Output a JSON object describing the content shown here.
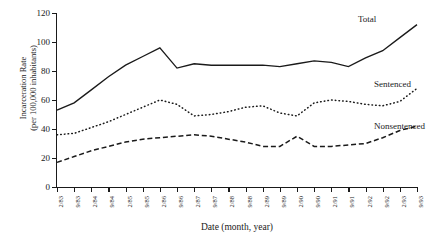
{
  "chart_data": {
    "type": "line",
    "title": "",
    "xlabel": "Date (month, year)",
    "ylabel_line1": "Incarceration Rate",
    "ylabel_line2": "(per 100,000 inhabitants)",
    "ylim": [
      0,
      120
    ],
    "yticks": [
      0,
      20,
      40,
      60,
      80,
      100,
      120
    ],
    "grid": false,
    "legend_position": "inline-right-of-line-ends",
    "categories": [
      "2/83",
      "9/83",
      "2/84",
      "9/84",
      "2/85",
      "9/85",
      "2/86",
      "9/86",
      "2/87",
      "9/87",
      "2/88",
      "9/88",
      "2/89",
      "9/89",
      "2/90",
      "9/90",
      "2/91",
      "9/91",
      "2/92",
      "9/92",
      "2/93",
      "9/93"
    ],
    "series": [
      {
        "name": "Total",
        "style": "solid",
        "values": [
          53,
          58,
          67,
          76,
          84,
          90,
          96,
          82,
          85,
          84,
          84,
          84,
          84,
          83,
          85,
          87,
          86,
          83,
          89,
          94,
          103,
          112
        ]
      },
      {
        "name": "Sentenced",
        "style": "dotted",
        "values": [
          36,
          37,
          41,
          45,
          50,
          55,
          60,
          57,
          49,
          50,
          52,
          55,
          56,
          51,
          49,
          58,
          60,
          59,
          57,
          56,
          59,
          68
        ]
      },
      {
        "name": "Nonsentenced",
        "style": "dashed",
        "values": [
          17,
          21,
          25,
          28,
          31,
          33,
          34,
          35,
          36,
          35,
          33,
          31,
          28,
          28,
          35,
          28,
          28,
          29,
          30,
          34,
          39,
          42
        ]
      }
    ]
  },
  "annotations": {
    "total": "Total",
    "sentenced": "Sentenced",
    "nonsentenced": "Nonsentenced"
  }
}
